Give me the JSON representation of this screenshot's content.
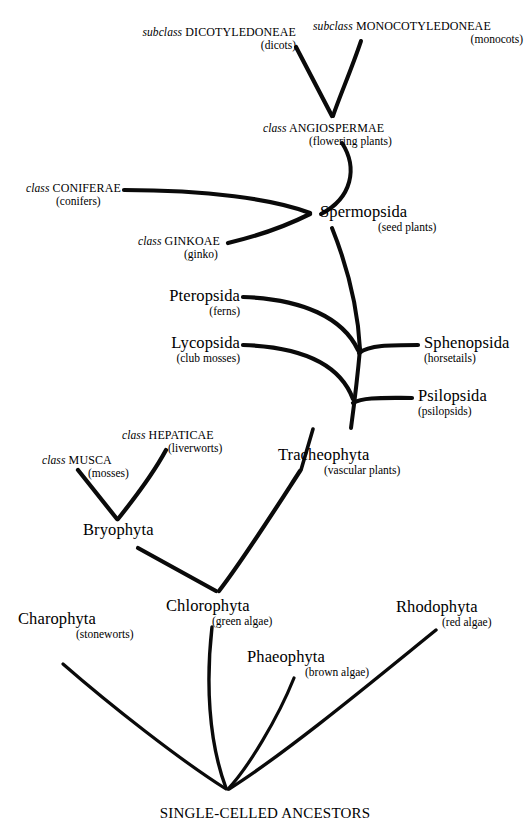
{
  "diagram": {
    "type": "phylogenetic-tree",
    "line_color": "#000000",
    "background": "#ffffff",
    "root": "SINGLE-CELLED ANCESTORS"
  },
  "nodes": {
    "dicotyledoneae": {
      "rank": "subclass",
      "taxon": "DICOTYLEDONEAE",
      "common": "(dicots)"
    },
    "monocotyledoneae": {
      "rank": "subclass",
      "taxon": "MONOCOTYLEDONEAE",
      "common": "(monocots)"
    },
    "angiospermae": {
      "rank": "class",
      "taxon": "ANGIOSPERMAE",
      "common": "(flowering plants)"
    },
    "coniferae": {
      "rank": "class",
      "taxon": "CONIFERAE",
      "common": "(conifers)"
    },
    "ginkoae": {
      "rank": "class",
      "taxon": "GINKOAE",
      "common": "(ginko)"
    },
    "spermopsida": {
      "rank": "",
      "taxon": "Spermopsida",
      "common": "(seed plants)"
    },
    "pteropsida": {
      "rank": "",
      "taxon": "Pteropsida",
      "common": "(ferns)"
    },
    "lycopsida": {
      "rank": "",
      "taxon": "Lycopsida",
      "common": "(club mosses)"
    },
    "sphenopsida": {
      "rank": "",
      "taxon": "Sphenopsida",
      "common": "(horsetails)"
    },
    "psilopsida": {
      "rank": "",
      "taxon": "Psilopsida",
      "common": "(psilopsids)"
    },
    "tracheophyta": {
      "rank": "",
      "taxon": "Tracheophyta",
      "common": "(vascular plants)"
    },
    "hepaticae": {
      "rank": "class",
      "taxon": "HEPATICAE",
      "common": "(liverworts)"
    },
    "musca": {
      "rank": "class",
      "taxon": "MUSCA",
      "common": "(mosses)"
    },
    "bryophyta": {
      "rank": "",
      "taxon": "Bryophyta",
      "common": ""
    },
    "chlorophyta": {
      "rank": "",
      "taxon": "Chlorophyta",
      "common": "(green algae)"
    },
    "charophyta": {
      "rank": "",
      "taxon": "Charophyta",
      "common": "(stoneworts)"
    },
    "phaeophyta": {
      "rank": "",
      "taxon": "Phaeophyta",
      "common": "(brown algae)"
    },
    "rhodophyta": {
      "rank": "",
      "taxon": "Rhodophyta",
      "common": "(red algae)"
    },
    "ancestors": {
      "rank": "",
      "taxon": "SINGLE-CELLED ANCESTORS",
      "common": ""
    }
  },
  "edges": [
    {
      "from": "dicotyledoneae",
      "to": "angiospermae"
    },
    {
      "from": "monocotyledoneae",
      "to": "angiospermae"
    },
    {
      "from": "angiospermae",
      "to": "spermopsida"
    },
    {
      "from": "coniferae",
      "to": "spermopsida"
    },
    {
      "from": "ginkoae",
      "to": "spermopsida"
    },
    {
      "from": "spermopsida",
      "to": "tracheophyta"
    },
    {
      "from": "pteropsida",
      "to": "tracheophyta"
    },
    {
      "from": "sphenopsida",
      "to": "tracheophyta"
    },
    {
      "from": "lycopsida",
      "to": "tracheophyta"
    },
    {
      "from": "psilopsida",
      "to": "tracheophyta"
    },
    {
      "from": "musca",
      "to": "bryophyta"
    },
    {
      "from": "hepaticae",
      "to": "bryophyta"
    },
    {
      "from": "bryophyta",
      "to": "chlorophyta"
    },
    {
      "from": "tracheophyta",
      "to": "chlorophyta"
    },
    {
      "from": "chlorophyta",
      "to": "ancestors"
    },
    {
      "from": "charophyta",
      "to": "ancestors"
    },
    {
      "from": "phaeophyta",
      "to": "ancestors"
    },
    {
      "from": "rhodophyta",
      "to": "ancestors"
    }
  ]
}
